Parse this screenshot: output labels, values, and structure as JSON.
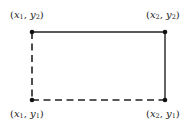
{
  "diagram": {
    "title": "",
    "colors": {
      "stroke": "#222222",
      "background": "#ffffff"
    },
    "points": [
      {
        "id": "top-left",
        "x_var": "x",
        "x_sub": "1",
        "y_var": "y",
        "y_sub": "2",
        "label": "(x1, y2)",
        "px": 32,
        "py": 32
      },
      {
        "id": "top-right",
        "x_var": "x",
        "x_sub": "2",
        "y_var": "y",
        "y_sub": "2",
        "label": "(x2, y2)",
        "px": 165,
        "py": 32
      },
      {
        "id": "bottom-left",
        "x_var": "x",
        "x_sub": "1",
        "y_var": "y",
        "y_sub": "1",
        "label": "(x1, y1)",
        "px": 32,
        "py": 100
      },
      {
        "id": "bottom-right",
        "x_var": "x",
        "x_sub": "2",
        "y_var": "y",
        "y_sub": "1",
        "label": "(x2, y1)",
        "px": 165,
        "py": 100
      }
    ],
    "edges": [
      {
        "from": "top-left",
        "to": "top-right",
        "style": "solid"
      },
      {
        "from": "top-right",
        "to": "bottom-right",
        "style": "solid"
      },
      {
        "from": "bottom-left",
        "to": "bottom-right",
        "style": "dashed"
      },
      {
        "from": "top-left",
        "to": "bottom-left",
        "style": "dashed"
      }
    ]
  }
}
